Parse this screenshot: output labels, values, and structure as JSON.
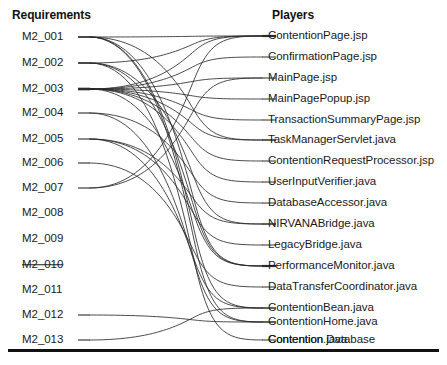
{
  "diagram": {
    "type": "bipartite-traceability-graph",
    "background_color": "#ffffff",
    "edge_color": "#2b2b2b",
    "rule_color": "#111111",
    "columns": {
      "left": {
        "header": "Requirements",
        "count": 13
      },
      "right": {
        "header": "Players",
        "count": 16
      }
    },
    "requirements": [
      {
        "id": "M2_001",
        "label": "M2_001",
        "struck_through": false,
        "y": 37,
        "degree": 5
      },
      {
        "id": "M2_002",
        "label": "M2_002",
        "struck_through": false,
        "y": 63,
        "degree": 4
      },
      {
        "id": "M2_003",
        "label": "M2_003",
        "struck_through": false,
        "y": 89,
        "degree": 9
      },
      {
        "id": "M2_004",
        "label": "M2_004",
        "struck_through": false,
        "y": 113,
        "degree": 2
      },
      {
        "id": "M2_005",
        "label": "M2_005",
        "struck_through": false,
        "y": 139,
        "degree": 3
      },
      {
        "id": "M2_006",
        "label": "M2_006",
        "struck_through": false,
        "y": 163,
        "degree": 1
      },
      {
        "id": "M2_007",
        "label": "M2_007",
        "struck_through": false,
        "y": 188,
        "degree": 2
      },
      {
        "id": "M2_008",
        "label": "M2_008",
        "struck_through": false,
        "y": 213,
        "degree": 0
      },
      {
        "id": "M2_009",
        "label": "M2_009",
        "struck_through": false,
        "y": 239,
        "degree": 0
      },
      {
        "id": "M2_010",
        "label": "M2_010",
        "struck_through": true,
        "y": 265,
        "degree": 0
      },
      {
        "id": "M2_011",
        "label": "M2_011",
        "struck_through": false,
        "y": 290,
        "degree": 0
      },
      {
        "id": "M2_012",
        "label": "M2_012",
        "struck_through": false,
        "y": 315,
        "degree": 1
      },
      {
        "id": "M2_013",
        "label": "M2_013",
        "struck_through": false,
        "y": 340,
        "degree": 1
      }
    ],
    "players": [
      {
        "id": "ContentionPage.jsp",
        "label": "ContentionPage.jsp",
        "y": 36,
        "degree": 3
      },
      {
        "id": "ConfirmationPage.jsp",
        "label": "ConfirmationPage.jsp",
        "y": 57,
        "degree": 1
      },
      {
        "id": "MainPage.jsp",
        "label": "MainPage.jsp",
        "y": 78,
        "degree": 1
      },
      {
        "id": "MainPagePopup.jsp",
        "label": "MainPagePopup.jsp",
        "y": 99,
        "degree": 1
      },
      {
        "id": "TransactionSummaryPage.jsp",
        "label": "TransactionSummaryPage.jsp",
        "y": 120,
        "degree": 1
      },
      {
        "id": "TaskManagerServlet.java",
        "label": "TaskManagerServlet.java",
        "y": 140,
        "degree": 2
      },
      {
        "id": "ContentionRequestProcessor.jsp",
        "label": "ContentionRequestProcessor.jsp",
        "y": 161,
        "degree": 1
      },
      {
        "id": "UserInputVerifier.java",
        "label": "UserInputVerifier.java",
        "y": 182,
        "degree": 1
      },
      {
        "id": "DatabaseAccessor.java",
        "label": "DatabaseAccessor.java",
        "y": 203,
        "degree": 1
      },
      {
        "id": "NIRVANABridge.java",
        "label": "NIRVANABridge.java",
        "y": 224,
        "degree": 2
      },
      {
        "id": "LegacyBridge.java",
        "label": "LegacyBridge.java",
        "y": 245,
        "degree": 1
      },
      {
        "id": "PerformanceMonitor.java",
        "label": "PerformanceMonitor.java",
        "y": 266,
        "degree": 3
      },
      {
        "id": "DataTransferCoordinator.java",
        "label": "DataTransferCoordinator.java",
        "y": 287,
        "degree": 1
      },
      {
        "id": "ContentionBean.java",
        "label": "ContentionBean.java",
        "y": 308,
        "degree": 2
      },
      {
        "id": "ContentionHome.java",
        "label": "ContentionHome.java",
        "y": 322,
        "degree": 2
      },
      {
        "id": "Contention.java",
        "label": "Contention.java",
        "y": 340,
        "degree": 1
      }
    ],
    "edges": [
      {
        "from": "M2_001",
        "to": "ContentionPage.jsp"
      },
      {
        "from": "M2_001",
        "to": "TaskManagerServlet.java"
      },
      {
        "from": "M2_001",
        "to": "PerformanceMonitor.java"
      },
      {
        "from": "M2_001",
        "to": "ContentionBean.java"
      },
      {
        "from": "M2_001",
        "to": "ContentionHome.java"
      },
      {
        "from": "M2_002",
        "to": "ContentionPage.jsp"
      },
      {
        "from": "M2_002",
        "to": "NIRVANABridge.java"
      },
      {
        "from": "M2_002",
        "to": "PerformanceMonitor.java"
      },
      {
        "from": "M2_002",
        "to": "Contention.java"
      },
      {
        "from": "M2_003",
        "to": "ContentionPage.jsp"
      },
      {
        "from": "M2_003",
        "to": "ConfirmationPage.jsp"
      },
      {
        "from": "M2_003",
        "to": "MainPage.jsp"
      },
      {
        "from": "M2_003",
        "to": "MainPagePopup.jsp"
      },
      {
        "from": "M2_003",
        "to": "TransactionSummaryPage.jsp"
      },
      {
        "from": "M2_003",
        "to": "TaskManagerServlet.java"
      },
      {
        "from": "M2_003",
        "to": "ContentionRequestProcessor.jsp"
      },
      {
        "from": "M2_003",
        "to": "UserInputVerifier.java"
      },
      {
        "from": "M2_003",
        "to": "PerformanceMonitor.java"
      },
      {
        "from": "M2_004",
        "to": "DatabaseAccessor.java"
      },
      {
        "from": "M2_004",
        "to": "ContentionHome.java"
      },
      {
        "from": "M2_005",
        "to": "NIRVANABridge.java"
      },
      {
        "from": "M2_005",
        "to": "LegacyBridge.java"
      },
      {
        "from": "M2_005",
        "to": "ContentionBean.java"
      },
      {
        "from": "M2_006",
        "to": "DataTransferCoordinator.java"
      },
      {
        "from": "M2_007",
        "to": "MainPage.jsp"
      },
      {
        "from": "M2_007",
        "to": "ContentionPage.jsp"
      },
      {
        "from": "M2_012",
        "to": "ContentionHome.java"
      },
      {
        "from": "M2_013",
        "to": "ContentionBean.java"
      }
    ],
    "extra_player_labels": [
      {
        "label": "Contention Database",
        "y": 340
      }
    ]
  }
}
